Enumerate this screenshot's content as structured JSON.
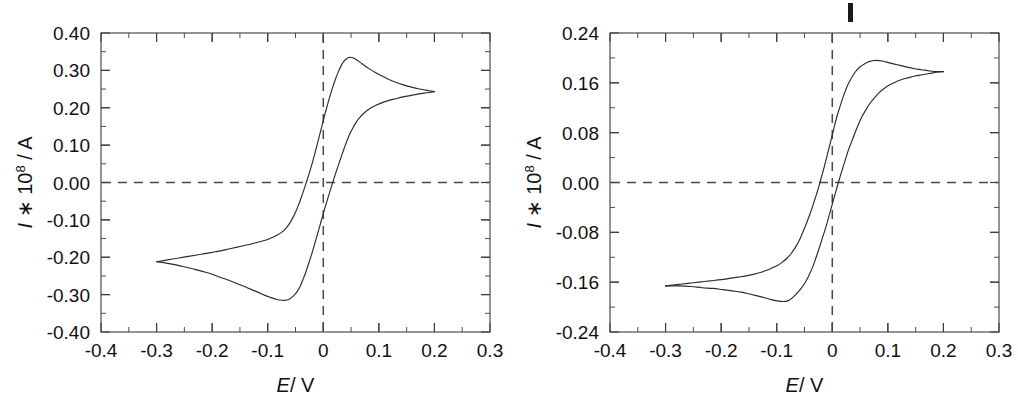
{
  "figure": {
    "caption_marker": "|",
    "background": "#ffffff",
    "curve_color": "#2b2b2b",
    "guide_color": "#4a4a4a",
    "axis_color": "#3c3c3c"
  },
  "panels": [
    {
      "id": "left",
      "name": "cv-plot-left",
      "axis_titles": {
        "x": "E/V",
        "x_italic": "E",
        "x_rest": "/ V",
        "y_pre": "I",
        "y_mid": " ∗ 10",
        "y_exp": "8",
        "y_post": " / A"
      },
      "chart_ref": 0
    },
    {
      "id": "right",
      "name": "cv-plot-right",
      "axis_titles": {
        "x": "E/V",
        "x_italic": "E",
        "x_rest": "/ V",
        "y_pre": "I",
        "y_mid": " ∗ 10",
        "y_exp": "8",
        "y_post": " / A"
      },
      "chart_ref": 1
    }
  ],
  "chart_data": [
    {
      "type": "line",
      "title": "",
      "xlabel": "E / V",
      "ylabel": "I * 10^8 / A",
      "xlim": [
        -0.4,
        0.3
      ],
      "ylim": [
        -0.4,
        0.4
      ],
      "xticks": [
        -0.4,
        -0.3,
        -0.2,
        -0.1,
        0,
        0.1,
        0.2,
        0.3
      ],
      "xticklabels": [
        "-0.4",
        "-0.3",
        "-0.2",
        "-0.1",
        "0",
        "0.1",
        "0.2",
        "0.3"
      ],
      "yticks": [
        0.4,
        0.3,
        0.2,
        0.1,
        0.0,
        -0.1,
        -0.2,
        -0.3,
        -0.4
      ],
      "yticklabels": [
        "0.40",
        "0.30",
        "0.20",
        "0.10",
        "0.00",
        "-0.10",
        "-0.20",
        "-0.30",
        "-0.40"
      ],
      "minor_tick_step_x": 0.05,
      "minor_tick_step_y": 0.05,
      "grid": false,
      "legend": "none",
      "guides": {
        "hline": 0.0,
        "vline": 0.0
      },
      "annotations": {
        "anodic_peak": {
          "x": 0.047,
          "y": 0.335
        },
        "cathodic_peak": {
          "x": -0.048,
          "y": -0.315
        },
        "switch_anodic": {
          "x": 0.2,
          "y": 0.243
        },
        "switch_cathodic": {
          "x": -0.3,
          "y": -0.212
        },
        "zero_crossing_forward": -0.025,
        "zero_crossing_reverse": 0.022
      },
      "series": [
        {
          "name": "forward-anodic-scan",
          "points": [
            [
              -0.3,
              -0.212
            ],
            [
              -0.28,
              -0.207
            ],
            [
              -0.26,
              -0.202
            ],
            [
              -0.24,
              -0.197
            ],
            [
              -0.22,
              -0.192
            ],
            [
              -0.2,
              -0.187
            ],
            [
              -0.185,
              -0.183
            ],
            [
              -0.17,
              -0.178
            ],
            [
              -0.155,
              -0.173
            ],
            [
              -0.14,
              -0.168
            ],
            [
              -0.128,
              -0.164
            ],
            [
              -0.118,
              -0.16
            ],
            [
              -0.108,
              -0.156
            ],
            [
              -0.098,
              -0.151
            ],
            [
              -0.09,
              -0.146
            ],
            [
              -0.082,
              -0.14
            ],
            [
              -0.074,
              -0.132
            ],
            [
              -0.067,
              -0.122
            ],
            [
              -0.06,
              -0.108
            ],
            [
              -0.054,
              -0.092
            ],
            [
              -0.048,
              -0.073
            ],
            [
              -0.043,
              -0.054
            ],
            [
              -0.038,
              -0.033
            ],
            [
              -0.033,
              -0.011
            ],
            [
              -0.028,
              0.012
            ],
            [
              -0.023,
              0.036
            ],
            [
              -0.018,
              0.062
            ],
            [
              -0.013,
              0.09
            ],
            [
              -0.008,
              0.119
            ],
            [
              -0.003,
              0.148
            ],
            [
              0.002,
              0.177
            ],
            [
              0.007,
              0.205
            ],
            [
              0.012,
              0.231
            ],
            [
              0.017,
              0.255
            ],
            [
              0.022,
              0.277
            ],
            [
              0.027,
              0.296
            ],
            [
              0.032,
              0.312
            ],
            [
              0.037,
              0.324
            ],
            [
              0.042,
              0.331
            ],
            [
              0.047,
              0.335
            ],
            [
              0.053,
              0.334
            ],
            [
              0.059,
              0.329
            ],
            [
              0.066,
              0.322
            ],
            [
              0.074,
              0.313
            ],
            [
              0.083,
              0.304
            ],
            [
              0.093,
              0.295
            ],
            [
              0.104,
              0.286
            ],
            [
              0.116,
              0.277
            ],
            [
              0.129,
              0.269
            ],
            [
              0.143,
              0.262
            ],
            [
              0.157,
              0.256
            ],
            [
              0.171,
              0.251
            ],
            [
              0.185,
              0.247
            ],
            [
              0.2,
              0.243
            ]
          ]
        },
        {
          "name": "reverse-cathodic-scan",
          "points": [
            [
              0.2,
              0.243
            ],
            [
              0.186,
              0.24
            ],
            [
              0.172,
              0.237
            ],
            [
              0.158,
              0.233
            ],
            [
              0.144,
              0.229
            ],
            [
              0.13,
              0.224
            ],
            [
              0.117,
              0.219
            ],
            [
              0.105,
              0.213
            ],
            [
              0.094,
              0.206
            ],
            [
              0.084,
              0.198
            ],
            [
              0.075,
              0.188
            ],
            [
              0.067,
              0.176
            ],
            [
              0.06,
              0.163
            ],
            [
              0.054,
              0.148
            ],
            [
              0.048,
              0.131
            ],
            [
              0.043,
              0.113
            ],
            [
              0.038,
              0.093
            ],
            [
              0.033,
              0.072
            ],
            [
              0.028,
              0.05
            ],
            [
              0.023,
              0.028
            ],
            [
              0.018,
              0.005
            ],
            [
              0.013,
              -0.019
            ],
            [
              0.008,
              -0.043
            ],
            [
              0.003,
              -0.068
            ],
            [
              -0.002,
              -0.094
            ],
            [
              -0.007,
              -0.12
            ],
            [
              -0.012,
              -0.146
            ],
            [
              -0.017,
              -0.172
            ],
            [
              -0.022,
              -0.197
            ],
            [
              -0.027,
              -0.22
            ],
            [
              -0.032,
              -0.242
            ],
            [
              -0.037,
              -0.261
            ],
            [
              -0.042,
              -0.279
            ],
            [
              -0.048,
              -0.294
            ],
            [
              -0.054,
              -0.304
            ],
            [
              -0.06,
              -0.311
            ],
            [
              -0.067,
              -0.315
            ],
            [
              -0.075,
              -0.315
            ],
            [
              -0.084,
              -0.313
            ],
            [
              -0.094,
              -0.308
            ],
            [
              -0.105,
              -0.302
            ],
            [
              -0.117,
              -0.294
            ],
            [
              -0.13,
              -0.286
            ],
            [
              -0.144,
              -0.277
            ],
            [
              -0.159,
              -0.268
            ],
            [
              -0.175,
              -0.259
            ],
            [
              -0.192,
              -0.25
            ],
            [
              -0.21,
              -0.241
            ],
            [
              -0.229,
              -0.233
            ],
            [
              -0.249,
              -0.226
            ],
            [
              -0.27,
              -0.219
            ],
            [
              -0.285,
              -0.215
            ],
            [
              -0.3,
              -0.212
            ]
          ]
        }
      ]
    },
    {
      "type": "line",
      "title": "",
      "xlabel": "E / V",
      "ylabel": "I * 10^8 / A",
      "xlim": [
        -0.4,
        0.3
      ],
      "ylim": [
        -0.24,
        0.24
      ],
      "xticks": [
        -0.4,
        -0.3,
        -0.2,
        -0.1,
        0,
        0.1,
        0.2,
        0.3
      ],
      "xticklabels": [
        "-0.4",
        "-0.3",
        "-0.2",
        "-0.1",
        "0",
        "0.1",
        "0.2",
        "0.3"
      ],
      "yticks": [
        0.24,
        0.16,
        0.08,
        0.0,
        -0.08,
        -0.16,
        -0.24
      ],
      "yticklabels": [
        "0.24",
        "0.16",
        "0.08",
        "0.00",
        "-0.08",
        "-0.16",
        "-0.24"
      ],
      "minor_tick_step_x": 0.05,
      "minor_tick_step_y": 0.04,
      "grid": false,
      "legend": "none",
      "guides": {
        "hline": 0.0,
        "vline": 0.0
      },
      "annotations": {
        "anodic_peak": {
          "x": 0.078,
          "y": 0.196
        },
        "cathodic_peak": {
          "x": -0.08,
          "y": -0.19
        },
        "switch_anodic": {
          "x": 0.2,
          "y": 0.178
        },
        "switch_cathodic": {
          "x": -0.3,
          "y": -0.166
        },
        "zero_crossing_forward": -0.018,
        "zero_crossing_reverse": 0.01
      },
      "series": [
        {
          "name": "forward-anodic-scan",
          "points": [
            [
              -0.3,
              -0.166
            ],
            [
              -0.28,
              -0.164
            ],
            [
              -0.26,
              -0.162
            ],
            [
              -0.24,
              -0.16
            ],
            [
              -0.22,
              -0.158
            ],
            [
              -0.2,
              -0.156
            ],
            [
              -0.185,
              -0.154
            ],
            [
              -0.17,
              -0.152
            ],
            [
              -0.155,
              -0.15
            ],
            [
              -0.14,
              -0.147
            ],
            [
              -0.128,
              -0.144
            ],
            [
              -0.118,
              -0.141
            ],
            [
              -0.108,
              -0.137
            ],
            [
              -0.098,
              -0.133
            ],
            [
              -0.09,
              -0.128
            ],
            [
              -0.082,
              -0.122
            ],
            [
              -0.074,
              -0.114
            ],
            [
              -0.067,
              -0.105
            ],
            [
              -0.06,
              -0.094
            ],
            [
              -0.054,
              -0.082
            ],
            [
              -0.048,
              -0.069
            ],
            [
              -0.042,
              -0.055
            ],
            [
              -0.036,
              -0.04
            ],
            [
              -0.031,
              -0.026
            ],
            [
              -0.026,
              -0.012
            ],
            [
              -0.021,
              0.004
            ],
            [
              -0.016,
              0.02
            ],
            [
              -0.011,
              0.037
            ],
            [
              -0.006,
              0.055
            ],
            [
              -0.001,
              0.073
            ],
            [
              0.004,
              0.091
            ],
            [
              0.009,
              0.108
            ],
            [
              0.015,
              0.125
            ],
            [
              0.021,
              0.141
            ],
            [
              0.027,
              0.155
            ],
            [
              0.034,
              0.167
            ],
            [
              0.041,
              0.177
            ],
            [
              0.049,
              0.185
            ],
            [
              0.057,
              0.19
            ],
            [
              0.066,
              0.194
            ],
            [
              0.078,
              0.196
            ],
            [
              0.09,
              0.195
            ],
            [
              0.103,
              0.192
            ],
            [
              0.117,
              0.189
            ],
            [
              0.131,
              0.186
            ],
            [
              0.146,
              0.183
            ],
            [
              0.161,
              0.181
            ],
            [
              0.176,
              0.179
            ],
            [
              0.19,
              0.178
            ],
            [
              0.2,
              0.178
            ]
          ]
        },
        {
          "name": "reverse-cathodic-scan",
          "points": [
            [
              0.2,
              0.178
            ],
            [
              0.188,
              0.177
            ],
            [
              0.175,
              0.175
            ],
            [
              0.162,
              0.173
            ],
            [
              0.149,
              0.171
            ],
            [
              0.136,
              0.168
            ],
            [
              0.124,
              0.165
            ],
            [
              0.113,
              0.161
            ],
            [
              0.102,
              0.156
            ],
            [
              0.092,
              0.15
            ],
            [
              0.083,
              0.143
            ],
            [
              0.075,
              0.135
            ],
            [
              0.067,
              0.126
            ],
            [
              0.06,
              0.116
            ],
            [
              0.053,
              0.105
            ],
            [
              0.047,
              0.093
            ],
            [
              0.041,
              0.08
            ],
            [
              0.035,
              0.066
            ],
            [
              0.029,
              0.052
            ],
            [
              0.024,
              0.038
            ],
            [
              0.019,
              0.024
            ],
            [
              0.014,
              0.009
            ],
            [
              0.009,
              -0.006
            ],
            [
              0.004,
              -0.022
            ],
            [
              -0.001,
              -0.038
            ],
            [
              -0.006,
              -0.054
            ],
            [
              -0.011,
              -0.07
            ],
            [
              -0.017,
              -0.087
            ],
            [
              -0.023,
              -0.104
            ],
            [
              -0.029,
              -0.12
            ],
            [
              -0.035,
              -0.135
            ],
            [
              -0.042,
              -0.149
            ],
            [
              -0.049,
              -0.161
            ],
            [
              -0.057,
              -0.171
            ],
            [
              -0.065,
              -0.179
            ],
            [
              -0.073,
              -0.186
            ],
            [
              -0.08,
              -0.19
            ],
            [
              -0.089,
              -0.191
            ],
            [
              -0.099,
              -0.19
            ],
            [
              -0.11,
              -0.188
            ],
            [
              -0.122,
              -0.185
            ],
            [
              -0.135,
              -0.182
            ],
            [
              -0.149,
              -0.179
            ],
            [
              -0.164,
              -0.176
            ],
            [
              -0.18,
              -0.174
            ],
            [
              -0.197,
              -0.172
            ],
            [
              -0.215,
              -0.17
            ],
            [
              -0.234,
              -0.169
            ],
            [
              -0.254,
              -0.167
            ],
            [
              -0.275,
              -0.166
            ],
            [
              -0.3,
              -0.166
            ]
          ]
        }
      ]
    }
  ]
}
